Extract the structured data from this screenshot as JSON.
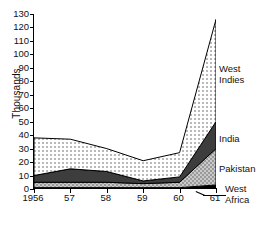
{
  "axis": {
    "ylabel": "Thousands",
    "yticks": [
      "0",
      "10",
      "20",
      "30",
      "40",
      "50",
      "60",
      "70",
      "80",
      "90",
      "100",
      "110",
      "120",
      "130"
    ],
    "xticks": [
      "1956",
      "57",
      "58",
      "59",
      "60",
      "61"
    ]
  },
  "series_labels": {
    "west_indies": "West\nIndies",
    "india": "India",
    "pakistan": "Pakistan",
    "west_africa": "West\nAfrica"
  },
  "chart_data": {
    "type": "area",
    "stacked": true,
    "title": "",
    "xlabel": "",
    "ylabel": "Thousands",
    "ylim": [
      0,
      130
    ],
    "ytick_step": 10,
    "grid": false,
    "legend_position": "right-inline",
    "categories": [
      "1956",
      "57",
      "58",
      "59",
      "60",
      "61"
    ],
    "x": [
      1956,
      1957,
      1958,
      1959,
      1960,
      1961
    ],
    "series": [
      {
        "name": "West Africa",
        "fill": "black",
        "color": "#000000",
        "values": [
          1,
          1,
          1,
          1,
          1,
          3
        ]
      },
      {
        "name": "Pakistan",
        "fill": "checker-gray",
        "color": "#b8b8b8",
        "values": [
          4,
          4,
          4,
          3,
          4,
          27
        ]
      },
      {
        "name": "India",
        "fill": "dark-gray",
        "color": "#3a3a3a",
        "values": [
          5,
          10,
          8,
          2,
          4,
          20
        ]
      },
      {
        "name": "West Indies",
        "fill": "light-dots",
        "color": "#e6e6e6",
        "values": [
          28,
          22,
          17,
          15,
          18,
          76
        ]
      }
    ],
    "cumulative_tops": {
      "west_africa": [
        1,
        1,
        1,
        1,
        1,
        3
      ],
      "pakistan": [
        5,
        5,
        5,
        4,
        5,
        30
      ],
      "india": [
        10,
        15,
        13,
        6,
        9,
        50
      ],
      "west_indies": [
        38,
        37,
        30,
        21,
        27,
        126
      ]
    },
    "totals": [
      38,
      37,
      30,
      21,
      27,
      126
    ]
  }
}
